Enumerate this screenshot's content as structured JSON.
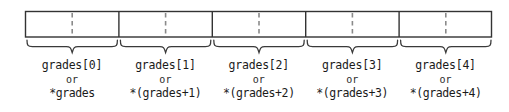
{
  "diagram": {
    "array_name": "grades",
    "cell_count": 5,
    "colors": {
      "box_stroke": "#333333",
      "divider_solid": "#333333",
      "divider_dashed": "#8a8a8a",
      "brace_stroke": "#3a3a3a",
      "text": "#1b1b1b",
      "background": "#ffffff"
    },
    "geometry": {
      "box_left": 25,
      "box_right": 492,
      "box_top": 11,
      "box_bottom": 37,
      "cell_width": 93.4,
      "brace_top": 40,
      "brace_tip": 53
    },
    "or_label": "or",
    "cells": [
      {
        "index": 0,
        "index_label": "grades[0]",
        "or_label": "or",
        "deref_label": "*grades"
      },
      {
        "index": 1,
        "index_label": "grades[1]",
        "or_label": "or",
        "deref_label": "*(grades+1)"
      },
      {
        "index": 2,
        "index_label": "grades[2]",
        "or_label": "or",
        "deref_label": "*(grades+2)"
      },
      {
        "index": 3,
        "index_label": "grades[3]",
        "or_label": "or",
        "deref_label": "*(grades+3)"
      },
      {
        "index": 4,
        "index_label": "grades[4]",
        "or_label": "or",
        "deref_label": "*(grades+4)"
      }
    ]
  }
}
